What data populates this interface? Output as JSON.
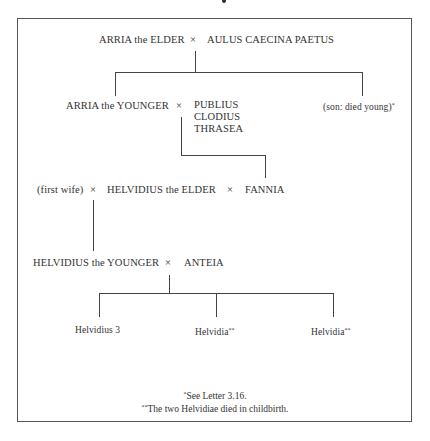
{
  "diagram": {
    "type": "family-tree",
    "generations": [
      {
        "row": 1,
        "union": {
          "partner_a": "ARRIA the ELDER",
          "marriage_symbol": "×",
          "partner_b": "AULUS CAECINA PAETUS"
        }
      },
      {
        "row": 2,
        "union": {
          "partner_a": "ARRIA the YOUNGER",
          "marriage_symbol": "×",
          "partner_b_lines": [
            "PUBLIUS",
            "CLODIUS",
            "THRASEA"
          ]
        },
        "sibling": {
          "label": "(son: died young)",
          "marker": "*"
        }
      },
      {
        "row": 3,
        "unions": {
          "first_wife": "(first wife)",
          "symbol_1": "×",
          "center": "HELVIDIUS the ELDER",
          "symbol_2": "×",
          "second_wife": "FANNIA"
        }
      },
      {
        "row": 4,
        "union": {
          "partner_a": "HELVIDIUS the YOUNGER",
          "marriage_symbol": "×",
          "partner_b": "ANTEIA"
        }
      },
      {
        "row": 5,
        "children": [
          {
            "label": "Helvidius 3",
            "marker": ""
          },
          {
            "label": "Helvidia",
            "marker": "**"
          },
          {
            "label": "Helvidia",
            "marker": "**"
          }
        ]
      }
    ],
    "footnotes": [
      {
        "marker": "*",
        "text": "See Letter 3.16."
      },
      {
        "marker": "**",
        "text": "The two Helvidiae died in childbirth."
      }
    ]
  }
}
